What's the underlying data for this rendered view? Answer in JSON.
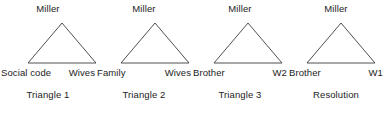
{
  "figure": {
    "background_color": "#ffffff",
    "line_color": "#3c3c3c",
    "text_color": "#1c1c1c"
  },
  "panels": [
    {
      "apex_label": "Miller",
      "base_left_label": "Social code",
      "base_right_label": "Wives",
      "caption": "Triangle 1"
    },
    {
      "apex_label": "Miller",
      "base_left_label": "Family",
      "base_right_label": "Wives",
      "caption": "Triangle 2"
    },
    {
      "apex_label": "Miller",
      "base_left_label": "Brother",
      "base_right_label": "W2",
      "caption": "Triangle 3"
    },
    {
      "apex_label": "Miller",
      "base_left_label": "Brother",
      "base_right_label": "W1",
      "caption": "Resolution"
    }
  ]
}
